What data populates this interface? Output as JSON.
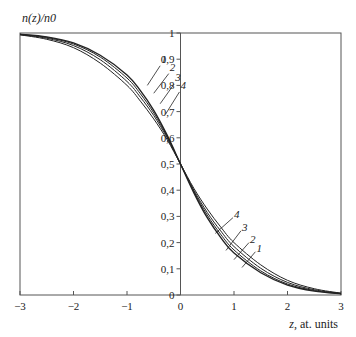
{
  "chart_data": {
    "type": "line",
    "title": "",
    "ylabel": "n(z)/n0",
    "xlabel_var": "z",
    "xlabel_unit": ", at. units",
    "xlim": [
      -3,
      3
    ],
    "ylim": [
      0,
      1
    ],
    "grid": false,
    "x_ticks": [
      -3,
      -2,
      -1,
      0,
      1,
      2,
      3
    ],
    "x_tick_labels": [
      "−3",
      "−2",
      "−1",
      "0",
      "1",
      "2",
      "3"
    ],
    "y_ticks": [
      0,
      0.1,
      0.2,
      0.3,
      0.4,
      0.5,
      0.6,
      0.7,
      0.8,
      0.9,
      1
    ],
    "y_tick_labels": [
      "0",
      "0,1",
      "0,2",
      "0,3",
      "0,4",
      "0,5",
      "0,6",
      "0,7",
      "0,8",
      "0,9",
      "1"
    ],
    "x": [
      -3,
      -2.5,
      -2,
      -1.5,
      -1,
      -0.75,
      -0.5,
      -0.25,
      0,
      0.25,
      0.5,
      0.75,
      1,
      1.5,
      2,
      2.5,
      3
    ],
    "series": [
      {
        "name": "1",
        "values": [
          0.995,
          0.985,
          0.962,
          0.915,
          0.84,
          0.78,
          0.705,
          0.61,
          0.5,
          0.39,
          0.295,
          0.22,
          0.16,
          0.085,
          0.038,
          0.015,
          0.005
        ]
      },
      {
        "name": "2",
        "values": [
          0.995,
          0.983,
          0.958,
          0.908,
          0.828,
          0.768,
          0.695,
          0.605,
          0.5,
          0.395,
          0.305,
          0.232,
          0.172,
          0.092,
          0.042,
          0.017,
          0.005
        ]
      },
      {
        "name": "3",
        "values": [
          0.994,
          0.98,
          0.952,
          0.898,
          0.815,
          0.755,
          0.685,
          0.6,
          0.5,
          0.4,
          0.315,
          0.245,
          0.185,
          0.102,
          0.048,
          0.02,
          0.006
        ]
      },
      {
        "name": "4",
        "values": [
          0.993,
          0.976,
          0.944,
          0.885,
          0.8,
          0.74,
          0.672,
          0.593,
          0.5,
          0.407,
          0.328,
          0.26,
          0.2,
          0.115,
          0.056,
          0.024,
          0.007
        ]
      }
    ],
    "curve_labels": [
      {
        "text": "1",
        "series": "1"
      },
      {
        "text": "2",
        "series": "2"
      },
      {
        "text": "3",
        "series": "3"
      },
      {
        "text": "4",
        "series": "4"
      }
    ],
    "colors": {
      "line": "#222222",
      "frame": "#555555"
    }
  }
}
